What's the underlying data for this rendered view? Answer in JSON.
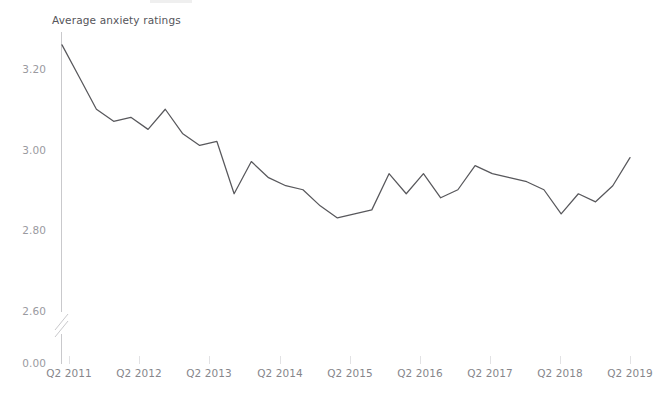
{
  "chart_data": {
    "type": "line",
    "title": "Average anxiety ratings",
    "xlabel": "",
    "ylabel": "",
    "grid": false,
    "legend": null,
    "axis_break": true,
    "axis_break_note": "y-axis broken between 0.00 and 2.60",
    "ylim": [
      2.55,
      3.3
    ],
    "yticks": [
      0.0,
      2.6,
      2.8,
      3.0,
      3.2
    ],
    "ytick_labels": [
      "0.00",
      "2.60",
      "2.80",
      "3.00",
      "3.20"
    ],
    "xtick_labels": [
      "Q2 2011",
      "Q2 2012",
      "Q2 2013",
      "Q2 2014",
      "Q2 2015",
      "Q2 2016",
      "Q2 2017",
      "Q2 2018",
      "Q2 2019"
    ],
    "x": [
      "Q1 2011",
      "Q2 2011",
      "Q3 2011",
      "Q4 2011",
      "Q1 2012",
      "Q2 2012",
      "Q3 2012",
      "Q4 2012",
      "Q1 2013",
      "Q2 2013",
      "Q3 2013",
      "Q4 2013",
      "Q1 2014",
      "Q2 2014",
      "Q3 2014",
      "Q4 2014",
      "Q1 2015",
      "Q2 2015",
      "Q3 2015",
      "Q4 2015",
      "Q1 2016",
      "Q2 2016",
      "Q3 2016",
      "Q4 2016",
      "Q1 2017",
      "Q2 2017",
      "Q3 2017",
      "Q4 2017",
      "Q1 2018",
      "Q2 2018",
      "Q3 2018",
      "Q4 2018",
      "Q1 2019",
      "Q2 2019"
    ],
    "values": [
      3.26,
      3.18,
      3.1,
      3.07,
      3.08,
      3.05,
      3.1,
      3.04,
      3.01,
      3.02,
      2.89,
      2.97,
      2.93,
      2.91,
      2.9,
      2.86,
      2.83,
      2.84,
      2.85,
      2.94,
      2.89,
      2.94,
      2.88,
      2.9,
      2.96,
      2.94,
      2.93,
      2.92,
      2.9,
      2.84,
      2.89,
      2.87,
      2.91,
      2.98
    ],
    "series": [
      {
        "name": "Average anxiety ratings",
        "color": "#58585c",
        "values": [
          3.26,
          3.18,
          3.1,
          3.07,
          3.08,
          3.05,
          3.1,
          3.04,
          3.01,
          3.02,
          2.89,
          2.97,
          2.93,
          2.91,
          2.9,
          2.86,
          2.83,
          2.84,
          2.85,
          2.94,
          2.89,
          2.94,
          2.88,
          2.9,
          2.96,
          2.94,
          2.93,
          2.92,
          2.9,
          2.84,
          2.89,
          2.87,
          2.91,
          2.98
        ]
      }
    ]
  },
  "colors": {
    "line": "#58585c",
    "axis": "#c9c9cc",
    "tick_label": "#9a9a9f",
    "xtick_label": "#86868b",
    "title_text": "#55555a",
    "background": "#ffffff"
  }
}
